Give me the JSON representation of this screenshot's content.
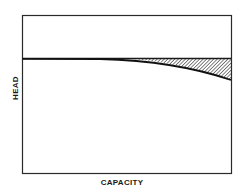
{
  "diagram": {
    "axes": {
      "xlabel": "CAPACITY",
      "ylabel": "HEAD"
    },
    "curves": [
      {
        "name": "reference-head-line",
        "style": "flat horizontal line",
        "description": "constant head across capacity"
      },
      {
        "name": "head-capacity-curve",
        "style": "drooping curve",
        "description": "head falls off at higher capacity"
      }
    ],
    "shaded_region": {
      "name": "head-loss-region",
      "pattern": "diagonal hatching",
      "description": "area between flat line and drooping curve at high capacity"
    },
    "colors": {
      "line": "#1a1a1a",
      "background": "#ffffff"
    }
  }
}
